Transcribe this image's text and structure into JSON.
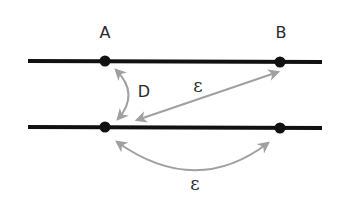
{
  "diagram": {
    "title": "",
    "colors": {
      "line": "#111111",
      "point": "#111111",
      "arrow": "#a0a0a0",
      "text": "#2a2a2a",
      "background": "#ffffff"
    },
    "lines": [
      {
        "id": "top-line",
        "x1": 28,
        "y1": 61,
        "x2": 322,
        "y2": 62
      },
      {
        "id": "bottom-line",
        "x1": 28,
        "y1": 127,
        "x2": 322,
        "y2": 128
      }
    ],
    "points": [
      {
        "id": "point-A",
        "label": "A",
        "x": 105,
        "y": 61
      },
      {
        "id": "point-B",
        "label": "B",
        "x": 280,
        "y": 62
      },
      {
        "id": "point-bottom-left",
        "label": "",
        "x": 105,
        "y": 127
      },
      {
        "id": "point-bottom-right",
        "label": "",
        "x": 280,
        "y": 128
      }
    ],
    "labels": {
      "A": "A",
      "B": "B",
      "D": "D",
      "epsilon_diagonal": "ε",
      "epsilon_bottom": "ε"
    },
    "arrows": [
      {
        "id": "arrow-D",
        "from": "point-A",
        "to": "point-bottom-left",
        "label": "D",
        "shape": "arc"
      },
      {
        "id": "arrow-epsilon-diagonal",
        "from": "point-bottom-left",
        "to": "point-B",
        "label": "ε",
        "shape": "straight"
      },
      {
        "id": "arrow-epsilon-bottom",
        "from": "point-bottom-left",
        "to": "point-bottom-right",
        "label": "ε",
        "shape": "arc"
      }
    ]
  }
}
